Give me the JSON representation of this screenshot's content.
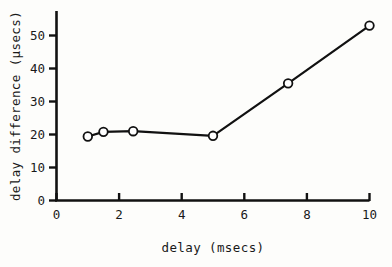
{
  "chart_data": {
    "type": "line",
    "title": "",
    "subtitle": "",
    "xlabel": "delay (msecs)",
    "ylabel": "delay difference (μsecs)",
    "xlim": [
      0,
      10
    ],
    "ylim": [
      0,
      55
    ],
    "xticks": [
      0,
      2,
      4,
      6,
      8,
      10
    ],
    "yticks": [
      0,
      10,
      20,
      30,
      40,
      50
    ],
    "xticklabels": [
      "0",
      "2",
      "4",
      "6",
      "8",
      "10"
    ],
    "yticklabels": [
      "0",
      "10",
      "20",
      "30",
      "40",
      "50"
    ],
    "grid": false,
    "legend": null,
    "legend_position": "none",
    "marker": "open-circle",
    "line_color": "#111111",
    "marker_facecolor": "#ffffff",
    "marker_edgecolor": "#111111",
    "series": [
      {
        "name": "delay difference",
        "x": [
          1.0,
          1.5,
          2.45,
          5.0,
          7.4,
          10.0
        ],
        "y": [
          19.4,
          20.8,
          21.0,
          19.6,
          35.5,
          53.0
        ]
      }
    ],
    "annotations": []
  },
  "axis_titles": {
    "x": "delay (msecs)",
    "y": "delay difference (μsecs)"
  },
  "ticks": {
    "x": [
      "0",
      "2",
      "4",
      "6",
      "8",
      "10"
    ],
    "y": [
      "0",
      "10",
      "20",
      "30",
      "40",
      "50"
    ]
  },
  "colors": {
    "background": "#fdfdfb",
    "ink": "#111111",
    "marker_fill": "#ffffff"
  }
}
